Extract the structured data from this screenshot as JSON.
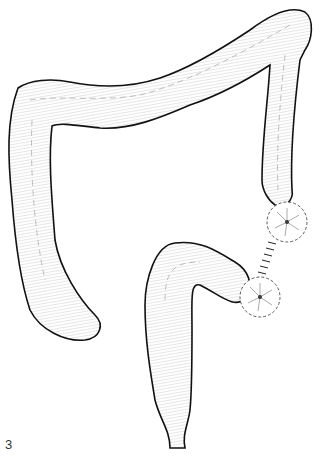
{
  "figure": {
    "label": "3",
    "colors": {
      "outline": "#111111",
      "hatch": "#888888",
      "fill": "#ffffff"
    }
  }
}
